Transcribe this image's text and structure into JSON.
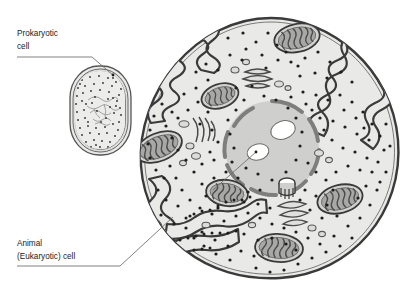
{
  "figure": {
    "background_color": "#ffffff",
    "line_color": "#3a3a3a",
    "text_color": "#1a1a1a"
  },
  "labels": {
    "prokaryotic": {
      "line1": "Prokaryotic",
      "line2": "cell"
    },
    "eukaryotic": {
      "line1": "Animal",
      "line2": "(Eukaryotic) cell"
    }
  },
  "prokaryotic_cell": {
    "name": "prokaryotic-cell",
    "shape": "rounded-capsule",
    "center": [
      100,
      110
    ],
    "width": 54,
    "height": 82,
    "wall_layers": 3,
    "cytoplasm_color": "#e4e4e2",
    "wall_color": "#d9d9d6",
    "ribosome_count": 150,
    "nucleoid": "central tangled strand"
  },
  "eukaryotic_cell": {
    "name": "animal-eukaryotic-cell",
    "center": [
      271,
      148
    ],
    "radius": 130,
    "membrane_color": "#3a3a3a",
    "cytoplasm_color": "#e6e6e4",
    "ribosome_count": 260,
    "organelles": [
      {
        "type": "nucleus",
        "label": "nucleus",
        "center": [
          272,
          148
        ],
        "rx": 46,
        "ry": 46,
        "envelope": "segmented-pores",
        "fill": "#cfcfcd"
      },
      {
        "type": "nucleolus",
        "label": "nucleolus",
        "center": [
          283,
          130
        ],
        "rx": 12,
        "ry": 9,
        "fill": "#ffffff"
      },
      {
        "type": "nucleolus",
        "label": "nucleolus",
        "center": [
          258,
          151
        ],
        "rx": 11,
        "ry": 8,
        "fill": "#ffffff"
      },
      {
        "type": "mitochondrion",
        "center": [
          297,
          38
        ],
        "rx": 23,
        "ry": 14,
        "rotate": -12
      },
      {
        "type": "mitochondrion",
        "center": [
          159,
          147
        ],
        "rx": 24,
        "ry": 14,
        "rotate": -22
      },
      {
        "type": "mitochondrion",
        "center": [
          220,
          96
        ],
        "rx": 19,
        "ry": 12,
        "rotate": -18
      },
      {
        "type": "mitochondrion",
        "center": [
          227,
          193
        ],
        "rx": 21,
        "ry": 13,
        "rotate": 8
      },
      {
        "type": "mitochondrion",
        "center": [
          279,
          248
        ],
        "rx": 24,
        "ry": 14,
        "rotate": 4
      },
      {
        "type": "mitochondrion",
        "center": [
          340,
          199
        ],
        "rx": 23,
        "ry": 14,
        "rotate": -14
      },
      {
        "type": "golgi",
        "center": [
          257,
          78
        ],
        "stacks": 3
      },
      {
        "type": "golgi",
        "center": [
          293,
          212
        ],
        "stacks": 3
      },
      {
        "type": "golgi",
        "center": [
          199,
          133
        ],
        "stacks": 4
      },
      {
        "type": "centriole",
        "center": [
          287,
          190
        ]
      },
      {
        "type": "rough-er",
        "region": "top-left invaginations"
      },
      {
        "type": "rough-er",
        "region": "top-right invaginations"
      },
      {
        "type": "rough-er",
        "region": "bottom-left invaginations"
      },
      {
        "type": "vesicles",
        "count": 14
      }
    ]
  },
  "leader_lines": {
    "prokaryotic": {
      "from": [
        17,
        57
      ],
      "elbow": [
        90,
        57
      ],
      "to": [
        113,
        76
      ]
    },
    "eukaryotic": {
      "from": [
        17,
        266
      ],
      "elbow": [
        118,
        266
      ],
      "to": [
        172,
        218
      ]
    },
    "nucleolus_pointer": {
      "from": [
        213,
        190
      ],
      "to": [
        257,
        152
      ]
    }
  }
}
